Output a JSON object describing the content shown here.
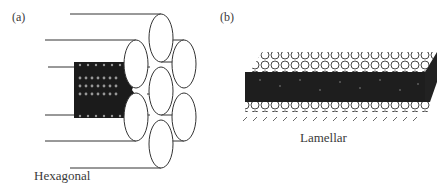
{
  "figure": {
    "panels": [
      {
        "id": "a",
        "tag": "(a)",
        "caption": "Hexagonal",
        "description": "Seven cylinders arranged in a hexagonal close-packed bundle, with a cutaway showing a lipid-coated cylinder (inverted hexagonal phase)"
      },
      {
        "id": "b",
        "tag": "(b)",
        "caption": "Lamellar",
        "description": "Stacked lipid bilayers with spherical head groups and dark tails forming a lamellar slab"
      }
    ],
    "colors": {
      "line": "#333333",
      "lipid_fill": "#1a1a1a",
      "background": "#ffffff"
    }
  }
}
